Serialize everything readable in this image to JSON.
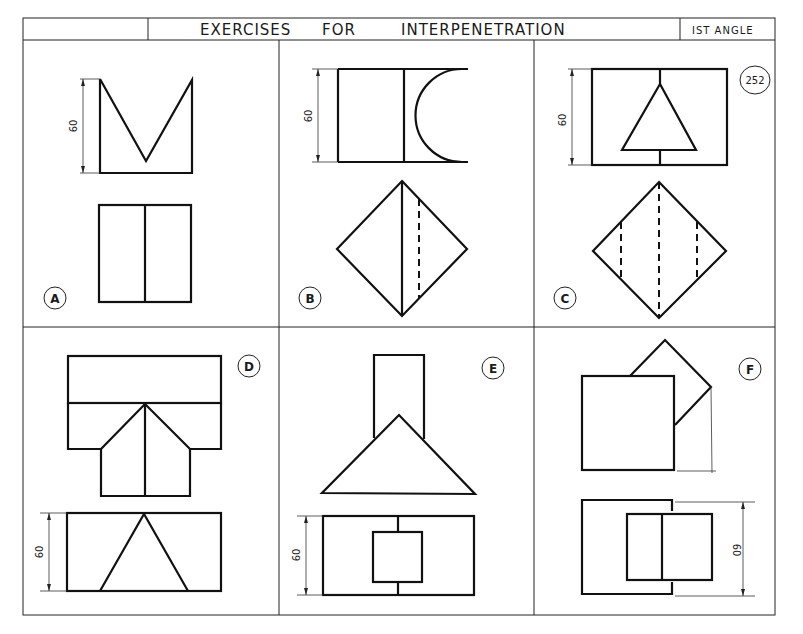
{
  "title_block": {
    "title_part1": "EXERCISES",
    "title_part2": "FOR",
    "title_part3": "INTERPENETRATION",
    "projection": "IST  ANGLE",
    "sheet_number": "252"
  },
  "exercises": [
    {
      "label": "A",
      "dimension": "60"
    },
    {
      "label": "B",
      "dimension": "60"
    },
    {
      "label": "C",
      "dimension": "60"
    },
    {
      "label": "D",
      "dimension": "60"
    },
    {
      "label": "E",
      "dimension": "60"
    },
    {
      "label": "F",
      "dimension": "60"
    }
  ],
  "colors": {
    "ink": "#111111",
    "paper": "#ffffff"
  }
}
